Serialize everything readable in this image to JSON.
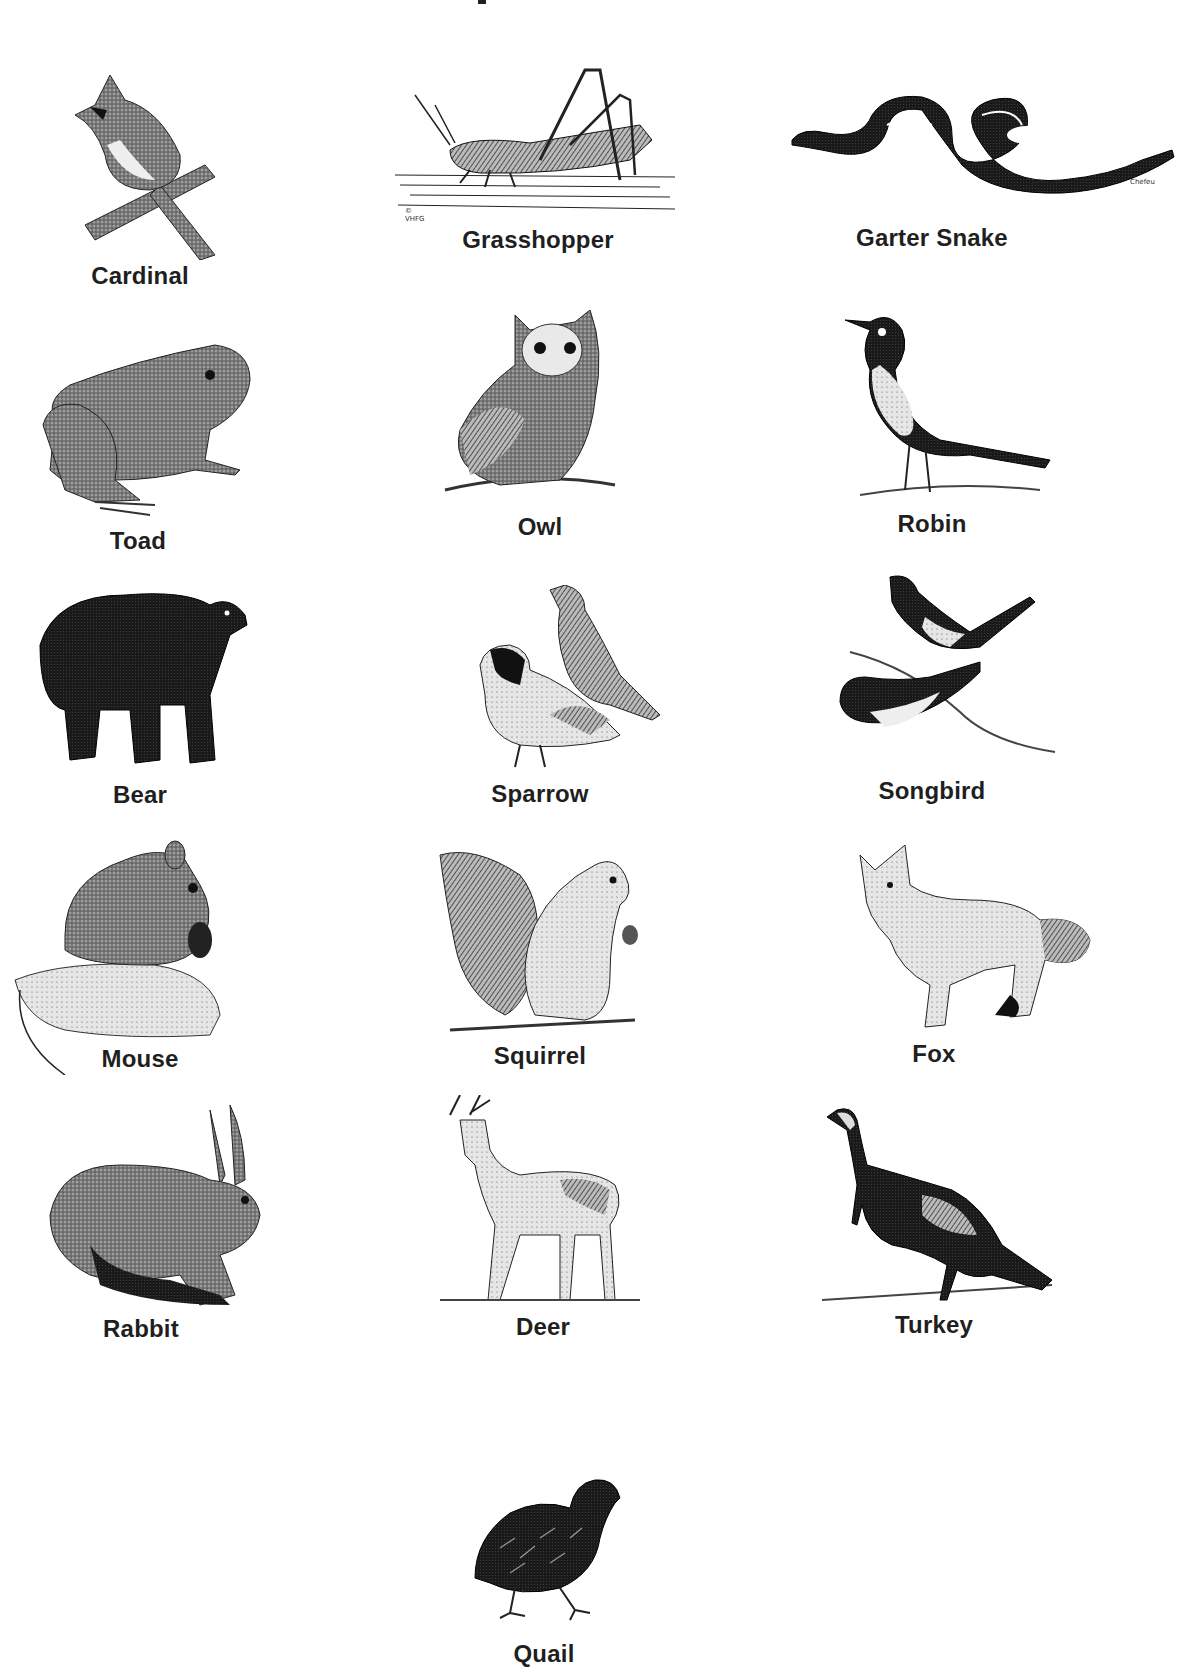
{
  "page": {
    "title_fragment_visible": true,
    "background": "#ffffff",
    "ink_color": "#1e1e1e"
  },
  "animals": [
    {
      "name": "Cardinal",
      "credit": ""
    },
    {
      "name": "Grasshopper",
      "credit": "© VHFG"
    },
    {
      "name": "Garter Snake",
      "credit": "Chefeu"
    },
    {
      "name": "Toad",
      "credit": ""
    },
    {
      "name": "Owl",
      "credit": ""
    },
    {
      "name": "Robin",
      "credit": ""
    },
    {
      "name": "Bear",
      "credit": ""
    },
    {
      "name": "Sparrow",
      "credit": ""
    },
    {
      "name": "Songbird",
      "credit": ""
    },
    {
      "name": "Mouse",
      "credit": ""
    },
    {
      "name": "Squirrel",
      "credit": ""
    },
    {
      "name": "Fox",
      "credit": ""
    },
    {
      "name": "Rabbit",
      "credit": ""
    },
    {
      "name": "Deer",
      "credit": ""
    },
    {
      "name": "Turkey",
      "credit": ""
    },
    {
      "name": "Quail",
      "credit": ""
    }
  ]
}
